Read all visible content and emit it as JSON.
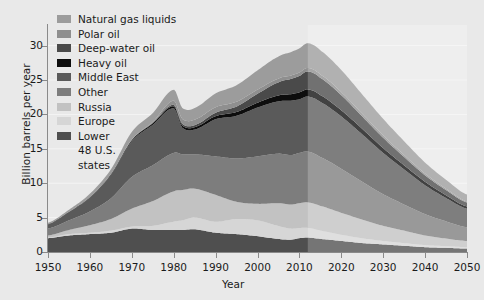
{
  "chart_data": {
    "type": "area",
    "title": "",
    "xlabel": "Year",
    "ylabel": "Billion barrels per year",
    "xlim": [
      1950,
      2050
    ],
    "ylim": [
      0,
      33
    ],
    "xticks": [
      1950,
      1960,
      1970,
      1980,
      1990,
      2000,
      2010,
      2020,
      2030,
      2040,
      2050
    ],
    "yticks": [
      0,
      5,
      10,
      15,
      20,
      25,
      30
    ],
    "grid": true,
    "legend_position": "upper-left",
    "stacked": true,
    "projection_starts": 2012,
    "x": [
      1950,
      1955,
      1960,
      1965,
      1970,
      1975,
      1980,
      1982,
      1985,
      1990,
      1995,
      2000,
      2005,
      2008,
      2010,
      2012,
      2015,
      2020,
      2025,
      2030,
      2035,
      2040,
      2045,
      2050
    ],
    "series": [
      {
        "name": "Lower 48 U.S. states",
        "color": "#4f4f4f",
        "values": [
          2.0,
          2.4,
          2.6,
          2.8,
          3.4,
          3.2,
          3.2,
          3.2,
          3.3,
          2.8,
          2.6,
          2.3,
          1.9,
          1.8,
          2.0,
          2.1,
          1.9,
          1.6,
          1.3,
          1.1,
          0.9,
          0.7,
          0.6,
          0.5
        ]
      },
      {
        "name": "Europe",
        "color": "#d6d6d6",
        "values": [
          0.1,
          0.2,
          0.2,
          0.3,
          0.3,
          0.6,
          1.2,
          1.4,
          1.7,
          1.6,
          2.2,
          2.3,
          1.9,
          1.6,
          1.5,
          1.4,
          1.2,
          0.9,
          0.7,
          0.5,
          0.4,
          0.3,
          0.25,
          0.2
        ]
      },
      {
        "name": "Russia",
        "color": "#c2c2c2",
        "values": [
          0.3,
          0.6,
          1.1,
          1.7,
          2.6,
          3.6,
          4.4,
          4.4,
          4.2,
          3.9,
          2.5,
          2.4,
          3.3,
          3.5,
          3.6,
          3.7,
          3.6,
          3.2,
          2.7,
          2.2,
          1.8,
          1.4,
          1.1,
          0.9
        ]
      },
      {
        "name": "Other",
        "color": "#7d7d7d",
        "values": [
          1.0,
          1.4,
          2.0,
          3.0,
          4.6,
          5.2,
          5.6,
          5.2,
          5.0,
          5.6,
          6.3,
          6.9,
          7.2,
          7.2,
          7.3,
          7.4,
          7.1,
          6.4,
          5.5,
          4.6,
          3.8,
          3.1,
          2.5,
          2.0
        ]
      },
      {
        "name": "Middle East",
        "color": "#5a5a5a",
        "values": [
          0.6,
          1.2,
          2.0,
          3.4,
          5.2,
          5.9,
          6.5,
          3.9,
          3.6,
          5.4,
          6.2,
          7.1,
          7.6,
          7.9,
          7.8,
          8.0,
          8.0,
          7.6,
          6.9,
          6.0,
          5.1,
          4.2,
          3.4,
          2.7
        ]
      },
      {
        "name": "Heavy oil",
        "color": "#0d0d0d",
        "values": [
          0.05,
          0.05,
          0.07,
          0.1,
          0.15,
          0.2,
          0.3,
          0.3,
          0.35,
          0.45,
          0.55,
          0.7,
          0.85,
          0.95,
          1.0,
          1.05,
          1.0,
          0.9,
          0.8,
          0.7,
          0.6,
          0.5,
          0.4,
          0.3
        ]
      },
      {
        "name": "Deep-water oil",
        "color": "#4a4a4a",
        "values": [
          0,
          0,
          0,
          0,
          0.05,
          0.1,
          0.2,
          0.25,
          0.3,
          0.5,
          0.8,
          1.3,
          1.9,
          2.2,
          2.4,
          2.6,
          2.5,
          2.2,
          1.8,
          1.5,
          1.2,
          0.95,
          0.75,
          0.6
        ]
      },
      {
        "name": "Polar oil",
        "color": "#8f8f8f",
        "values": [
          0,
          0,
          0,
          0,
          0.05,
          0.1,
          0.6,
          0.7,
          0.8,
          0.8,
          0.7,
          0.6,
          0.55,
          0.5,
          0.5,
          0.5,
          0.5,
          0.45,
          0.4,
          0.35,
          0.3,
          0.25,
          0.2,
          0.15
        ]
      },
      {
        "name": "Natural gas liquids",
        "color": "#9c9c9c",
        "values": [
          0.2,
          0.3,
          0.5,
          0.7,
          1.1,
          1.3,
          1.6,
          1.6,
          1.7,
          2.0,
          2.4,
          2.8,
          3.2,
          3.4,
          3.5,
          3.6,
          3.5,
          3.2,
          2.8,
          2.4,
          2.0,
          1.6,
          1.3,
          1.0
        ]
      }
    ]
  },
  "axes": {
    "ylabel": "Billion barrels per year",
    "xlabel": "Year",
    "ytick_labels": [
      "0",
      "5",
      "10",
      "15",
      "20",
      "25",
      "30"
    ],
    "xtick_labels": [
      "1950",
      "1960",
      "1970",
      "1980",
      "1990",
      "2000",
      "2010",
      "2020",
      "2030",
      "2040",
      "2050"
    ]
  },
  "legend": {
    "items": [
      {
        "label": "Natural gas liquids",
        "color": "#9c9c9c",
        "label2": ""
      },
      {
        "label": "Polar oil",
        "color": "#8f8f8f",
        "label2": ""
      },
      {
        "label": "Deep-water oil",
        "color": "#4a4a4a",
        "label2": ""
      },
      {
        "label": "Heavy oil",
        "color": "#0d0d0d",
        "label2": ""
      },
      {
        "label": "Middle East",
        "color": "#5a5a5a",
        "label2": ""
      },
      {
        "label": "Other",
        "color": "#7d7d7d",
        "label2": ""
      },
      {
        "label": "Russia",
        "color": "#c2c2c2",
        "label2": ""
      },
      {
        "label": "Europe",
        "color": "#d6d6d6",
        "label2": ""
      },
      {
        "label": "Lower",
        "color": "#4f4f4f",
        "label2": "48 U.S.\nstates"
      }
    ]
  }
}
